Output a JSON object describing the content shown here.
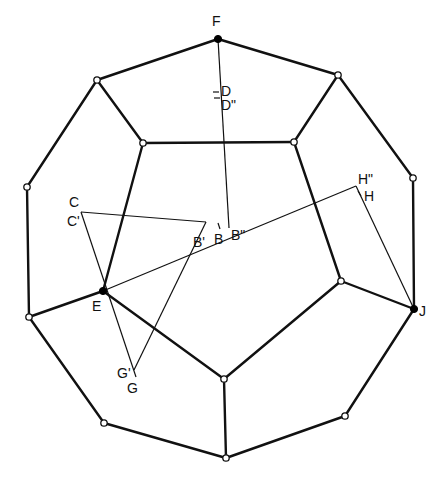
{
  "figure": {
    "background": "#ffffff",
    "stroke_color": "#111111"
  },
  "vertices": {
    "F": {
      "x": 218,
      "y": 39,
      "type": "filled"
    },
    "v1": {
      "x": 97,
      "y": 80,
      "type": "open"
    },
    "v2": {
      "x": 338,
      "y": 75,
      "type": "open"
    },
    "v3": {
      "x": 143,
      "y": 143,
      "type": "open"
    },
    "v4": {
      "x": 294,
      "y": 142,
      "type": "open"
    },
    "v5": {
      "x": 27,
      "y": 187,
      "type": "open"
    },
    "v6": {
      "x": 413,
      "y": 178,
      "type": "open"
    },
    "E": {
      "x": 103,
      "y": 291,
      "type": "filled"
    },
    "v7": {
      "x": 341,
      "y": 281,
      "type": "open"
    },
    "J": {
      "x": 414,
      "y": 309,
      "type": "filled"
    },
    "v8": {
      "x": 29,
      "y": 317,
      "type": "open"
    },
    "v9": {
      "x": 224,
      "y": 379,
      "type": "open"
    },
    "v10": {
      "x": 104,
      "y": 423,
      "type": "open"
    },
    "v11": {
      "x": 345,
      "y": 416,
      "type": "open"
    },
    "v12": {
      "x": 226,
      "y": 458,
      "type": "open"
    }
  },
  "edges": [
    [
      "F",
      "v1"
    ],
    [
      "F",
      "v2"
    ],
    [
      "v1",
      "v3"
    ],
    [
      "v2",
      "v4"
    ],
    [
      "v3",
      "v4"
    ],
    [
      "v1",
      "v5"
    ],
    [
      "v2",
      "v6"
    ],
    [
      "v3",
      "E"
    ],
    [
      "v4",
      "v7"
    ],
    [
      "v5",
      "v8"
    ],
    [
      "v6",
      "J"
    ],
    [
      "v8",
      "E"
    ],
    [
      "J",
      "v7"
    ],
    [
      "E",
      "v9"
    ],
    [
      "v7",
      "v9"
    ],
    [
      "v9",
      "v12"
    ],
    [
      "v8",
      "v10"
    ],
    [
      "J",
      "v11"
    ],
    [
      "v10",
      "v12"
    ],
    [
      "v11",
      "v12"
    ]
  ],
  "construction_lines": [
    {
      "from": [
        218,
        39
      ],
      "to": [
        229,
        228
      ]
    },
    {
      "from": [
        81,
        212
      ],
      "to": [
        206,
        222
      ]
    },
    {
      "from": [
        81,
        212
      ],
      "to": [
        136,
        377
      ]
    },
    {
      "from": [
        206,
        222
      ],
      "to": [
        134,
        370
      ]
    },
    {
      "from": [
        103,
        291
      ],
      "to": [
        356,
        186
      ]
    },
    {
      "from": [
        356,
        186
      ],
      "to": [
        414,
        309
      ]
    }
  ],
  "tick_marks": [
    {
      "x1": 213,
      "y1": 92,
      "x2": 219,
      "y2": 92
    },
    {
      "x1": 214,
      "y1": 98,
      "x2": 220,
      "y2": 98
    },
    {
      "x1": 218,
      "y1": 223,
      "x2": 220,
      "y2": 229
    },
    {
      "x1": 358,
      "y1": 191,
      "x2": 361,
      "y2": 196
    }
  ],
  "labels": [
    {
      "id": "F",
      "text": "F",
      "x": 212,
      "y": 26
    },
    {
      "id": "D",
      "text": "D",
      "x": 221,
      "y": 96
    },
    {
      "id": "D2",
      "text": "D\"",
      "x": 221,
      "y": 110
    },
    {
      "id": "C",
      "text": "C",
      "x": 69,
      "y": 207
    },
    {
      "id": "C1",
      "text": "C'",
      "x": 67,
      "y": 226
    },
    {
      "id": "B1",
      "text": "B'",
      "x": 193,
      "y": 247
    },
    {
      "id": "B",
      "text": "B",
      "x": 214,
      "y": 244
    },
    {
      "id": "B2",
      "text": "B\"",
      "x": 231,
      "y": 240
    },
    {
      "id": "H2",
      "text": "H\"",
      "x": 358,
      "y": 184
    },
    {
      "id": "H",
      "text": "H",
      "x": 364,
      "y": 201
    },
    {
      "id": "E",
      "text": "E",
      "x": 92,
      "y": 311
    },
    {
      "id": "J",
      "text": "J",
      "x": 419,
      "y": 316
    },
    {
      "id": "G1",
      "text": "G'",
      "x": 117,
      "y": 378
    },
    {
      "id": "G",
      "text": "G",
      "x": 127,
      "y": 393
    }
  ]
}
